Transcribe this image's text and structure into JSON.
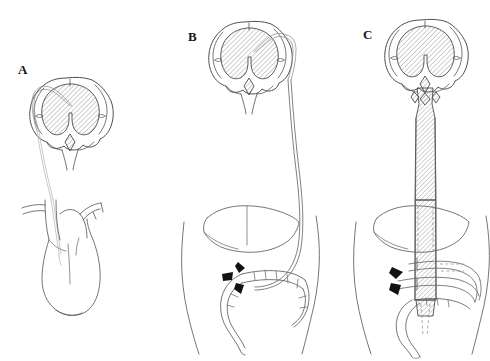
{
  "figure": {
    "kind": "medical-line-illustration",
    "background_color": "#ffffff",
    "ink_color": "#5d5b60",
    "label_color": "#17161a",
    "accent_marker_color": "#121114",
    "width": 490,
    "height": 361,
    "panel_count": 3
  },
  "panels": [
    {
      "id": "panel-a",
      "label": "A",
      "label_x": 18,
      "label_y": 70,
      "caption_semantic": "ventriculoatrial shunt: catheter from lateral ventricle to right atrium of heart",
      "structures": [
        "brain coronal section",
        "dilated lateral ventricles",
        "ventricular catheter",
        "great vessels",
        "aortic arch",
        "heart",
        "right atrium catheter tip"
      ],
      "marker_count": 0
    },
    {
      "id": "panel-b",
      "label": "B",
      "label_x": 188,
      "label_y": 37,
      "caption_semantic": "ventriculoperitoneal shunt: catheter from lateral ventricle tunneled to peritoneal cavity",
      "structures": [
        "brain coronal section",
        "dilated lateral ventricles",
        "ventricular catheter",
        "subcutaneous tunneled tubing",
        "torso outline",
        "liver",
        "colon",
        "sigmoid colon",
        "peritoneal catheter tip"
      ],
      "marker_count": 3,
      "marker_semantic": "arrowheads indicating distal peritoneal catheter tip"
    },
    {
      "id": "panel-c",
      "label": "C",
      "label_x": 363,
      "label_y": 35,
      "caption_semantic": "continuous dilated cerebrospinal fluid column extending from ventricles through spinal canal into abdomen",
      "structures": [
        "brain coronal section",
        "dilated lateral ventricles",
        "hatched cerebrospinal fluid column",
        "torso outline",
        "liver",
        "colon loop encircling column",
        "sigmoid colon",
        "hidden outline behind liver"
      ],
      "marker_count": 2,
      "marker_semantic": "arrowheads indicating dilated fluid column in abdomen"
    }
  ],
  "hatch": {
    "angle_degrees": 45,
    "color": "#7e7c83",
    "spacing_px": 2.4,
    "semantic": "ventricular and fluid-column hatching"
  }
}
